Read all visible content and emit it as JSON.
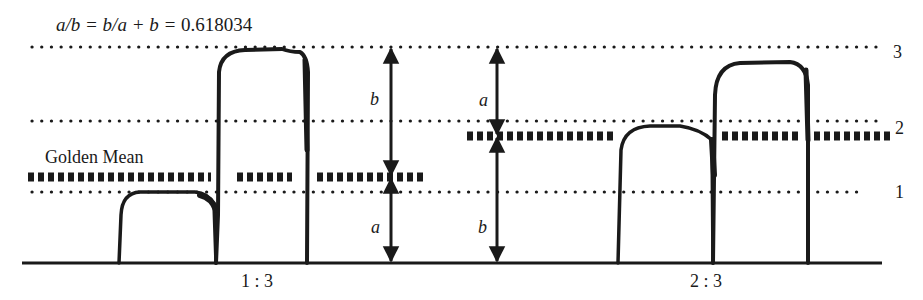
{
  "title": {
    "formula_italic": "a/b = b/a + b = ",
    "formula_value": "0.618034"
  },
  "legend": {
    "golden_mean_label": "Golden Mean"
  },
  "levels": [
    {
      "label": "1",
      "y": 192
    },
    {
      "label": "2",
      "y": 121
    },
    {
      "label": "3",
      "y": 47
    }
  ],
  "left_figure": {
    "ratio_label": "1 : 3",
    "golden_mean_y": 177,
    "arrow": {
      "x": 391,
      "upper_label": "b",
      "lower_label": "a"
    }
  },
  "right_figure": {
    "ratio_label": "2 : 3",
    "golden_mean_y": 136,
    "arrow": {
      "x": 497,
      "upper_label": "a",
      "lower_label": "b"
    }
  },
  "colors": {
    "ink": "#1a1a1a",
    "background": "#ffffff"
  }
}
